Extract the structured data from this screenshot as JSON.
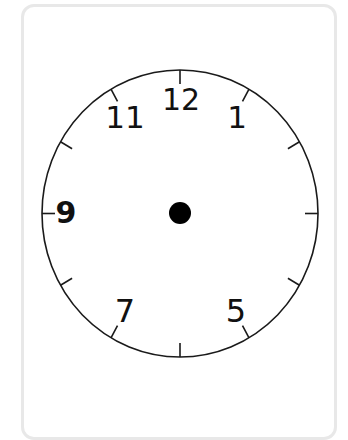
{
  "clock": {
    "center": {
      "x": 180,
      "y": 213.5
    },
    "radius_x": 138,
    "radius_y": 143.5,
    "stroke_color": "#1a1a1a",
    "dot_color": "#000000",
    "dot_radius": 11,
    "tick_count": 12,
    "numerals": {
      "n12": "12",
      "n1": "1",
      "n11": "11",
      "n9": "9",
      "n7": "7",
      "n5": "5"
    },
    "visible_numerals": [
      "12",
      "1",
      "11",
      "9",
      "7",
      "5"
    ],
    "missing_numerals": [
      "2",
      "3",
      "4",
      "6",
      "8",
      "10"
    ]
  },
  "card": {
    "border_color": "#e8e8e8",
    "background": "#ffffff"
  }
}
